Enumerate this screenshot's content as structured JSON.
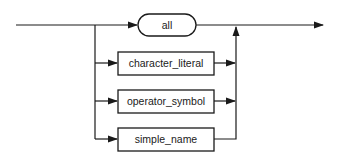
{
  "diagram": {
    "type": "railroad-syntax-diagram",
    "nodes": [
      {
        "id": "all",
        "label": "all",
        "shape": "rounded",
        "kind": "terminal"
      },
      {
        "id": "character_literal",
        "label": "character_literal",
        "shape": "rect",
        "kind": "nonterminal"
      },
      {
        "id": "operator_symbol",
        "label": "operator_symbol",
        "shape": "rect",
        "kind": "nonterminal"
      },
      {
        "id": "simple_name",
        "label": "simple_name",
        "shape": "rect",
        "kind": "nonterminal"
      }
    ],
    "flow": "entry -> choice(all | character_literal | operator_symbol | simple_name) -> exit",
    "colors": {
      "line": "#1a1a1a",
      "background": "#ffffff"
    }
  }
}
